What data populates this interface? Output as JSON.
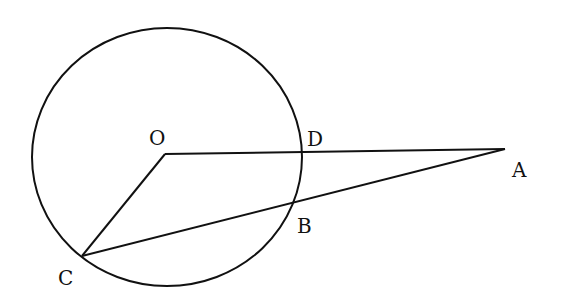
{
  "diagram": {
    "type": "geometry",
    "stroke_color": "#111111",
    "background": "#ffffff",
    "circle": {
      "center": "O",
      "cx": 167,
      "cy": 157,
      "rx": 135,
      "ry": 129
    },
    "points": {
      "O": {
        "x": 165,
        "y": 154,
        "label": "O",
        "lx": 149,
        "ly": 145
      },
      "D": {
        "x": 301,
        "y": 152,
        "label": "D",
        "lx": 307,
        "ly": 146
      },
      "A": {
        "x": 505,
        "y": 149,
        "label": "A",
        "lx": 512,
        "ly": 177
      },
      "B": {
        "x": 291,
        "y": 203,
        "label": "B",
        "lx": 297,
        "ly": 233
      },
      "C": {
        "x": 82,
        "y": 256,
        "label": "C",
        "lx": 58,
        "ly": 285
      }
    },
    "segments": [
      [
        "O",
        "A"
      ],
      [
        "O",
        "C"
      ],
      [
        "C",
        "A"
      ]
    ]
  }
}
